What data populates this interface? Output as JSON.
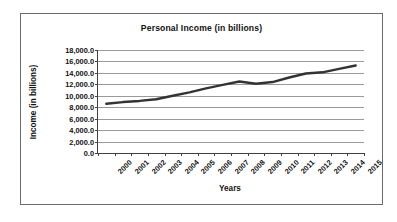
{
  "chart_data": {
    "type": "line",
    "title": "Personal Income (in billions)",
    "xlabel": "Years",
    "ylabel": "Income (in billions)",
    "categories": [
      "2000",
      "2001",
      "2002",
      "2003",
      "2004",
      "2005",
      "2006",
      "2007",
      "2008",
      "2009",
      "2010",
      "2011",
      "2012",
      "2013",
      "2014",
      "2015"
    ],
    "series": [
      {
        "name": "Personal Income",
        "color": "#333333",
        "values": [
          8600,
          8900,
          9100,
          9400,
          10000,
          10600,
          11300,
          11900,
          12500,
          12100,
          12400,
          13200,
          13900,
          14100,
          14700,
          15300
        ]
      }
    ],
    "ylim": [
      0,
      18000
    ],
    "ytick_values": [
      0,
      2000,
      4000,
      6000,
      8000,
      10000,
      12000,
      14000,
      16000,
      18000
    ],
    "ytick_labels": [
      "0.0",
      "2,000.0",
      "4,000.0",
      "6,000.0",
      "8,000.0",
      "10,000.0",
      "12,000.0",
      "14,000.0",
      "16,000.0",
      "18,000.0"
    ],
    "grid": true,
    "grid_color": "#9a9a9a",
    "legend": false,
    "legend_position": "none",
    "border_color": "#6b6b6b",
    "axis_color": "#404040",
    "background": "#ffffff"
  }
}
